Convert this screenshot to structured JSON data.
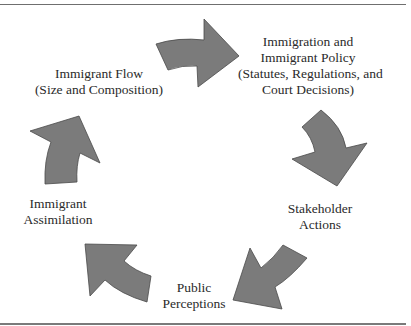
{
  "diagram": {
    "type": "cycle",
    "nodes": [
      {
        "id": "policy",
        "lines": [
          "Immigration and",
          "Immigrant Policy",
          "(Statutes, Regulations, and",
          "Court Decisions)"
        ]
      },
      {
        "id": "stakeholder",
        "lines": [
          "Stakeholder",
          "Actions"
        ]
      },
      {
        "id": "perceptions",
        "lines": [
          "Public",
          "Perceptions"
        ]
      },
      {
        "id": "assimilation",
        "lines": [
          "Immigrant",
          "Assimilation"
        ]
      },
      {
        "id": "flow",
        "lines": [
          "Immigrant Flow",
          "(Size and Composition)"
        ]
      }
    ],
    "edges": [
      {
        "from": "Immigrant Flow",
        "to": "Immigration and Immigrant Policy"
      },
      {
        "from": "Immigration and Immigrant Policy",
        "to": "Stakeholder Actions"
      },
      {
        "from": "Stakeholder Actions",
        "to": "Public Perceptions"
      },
      {
        "from": "Public Perceptions",
        "to": "Immigrant Assimilation"
      },
      {
        "from": "Immigrant Assimilation",
        "to": "Immigrant Flow"
      }
    ],
    "colors": {
      "arrow_fill": "#7b7b7b",
      "arrow_stroke": "#4a4a4a",
      "text": "#2a2a2a",
      "rule": "#6f6f6f"
    }
  }
}
